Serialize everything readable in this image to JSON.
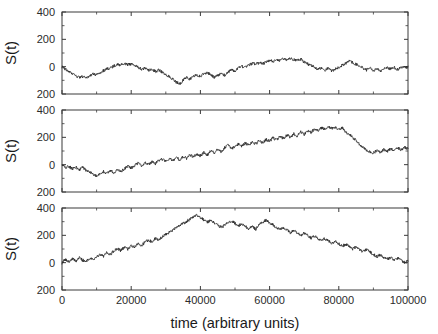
{
  "chart_data": {
    "type": "line",
    "title": "",
    "xlabel": "time (arbitrary units)",
    "ylabel": "S(t)",
    "xlim": [
      0,
      100000
    ],
    "ylim": [
      -200,
      400
    ],
    "xticks": [
      0,
      20000,
      40000,
      60000,
      80000,
      100000
    ],
    "xticklabels": [
      "0",
      "20000",
      "40000",
      "60000",
      "80000",
      "100000"
    ],
    "yticks": [
      -200,
      0,
      200,
      400
    ],
    "yticklabels": [
      "200",
      "0",
      "200",
      "400"
    ],
    "grid": false,
    "legend": null,
    "panels": [
      {
        "index": 0,
        "ylabel": "S(t)",
        "series_name": "S(t) realization 1",
        "x": [
          0,
          1000,
          2000,
          3000,
          4000,
          5000,
          6000,
          7000,
          8000,
          9000,
          10000,
          11000,
          12000,
          13000,
          14000,
          15000,
          16000,
          17000,
          18000,
          19000,
          20000,
          21000,
          22000,
          23000,
          24000,
          25000,
          26000,
          27000,
          28000,
          29000,
          30000,
          31000,
          32000,
          33000,
          34000,
          35000,
          36000,
          37000,
          38000,
          39000,
          40000,
          41000,
          42000,
          43000,
          44000,
          45000,
          46000,
          47000,
          48000,
          49000,
          50000,
          51000,
          52000,
          53000,
          54000,
          55000,
          56000,
          57000,
          58000,
          59000,
          60000,
          61000,
          62000,
          63000,
          64000,
          65000,
          66000,
          67000,
          68000,
          69000,
          70000,
          71000,
          72000,
          73000,
          74000,
          75000,
          76000,
          77000,
          78000,
          79000,
          80000,
          81000,
          82000,
          83000,
          84000,
          85000,
          86000,
          87000,
          88000,
          89000,
          90000,
          91000,
          92000,
          93000,
          94000,
          95000,
          96000,
          97000,
          98000,
          99000,
          100000
        ],
        "values": [
          0,
          -18,
          -38,
          -52,
          -68,
          -80,
          -72,
          -85,
          -66,
          -52,
          -60,
          -44,
          -30,
          -16,
          -8,
          5,
          18,
          12,
          24,
          14,
          20,
          8,
          -4,
          -18,
          -12,
          -28,
          -20,
          -34,
          -26,
          -40,
          -55,
          -72,
          -90,
          -112,
          -128,
          -100,
          -78,
          -92,
          -70,
          -60,
          -74,
          -52,
          -40,
          -60,
          -80,
          -66,
          -50,
          -62,
          -40,
          -22,
          -34,
          -12,
          2,
          -8,
          10,
          24,
          16,
          30,
          20,
          34,
          46,
          38,
          52,
          44,
          58,
          50,
          62,
          54,
          44,
          56,
          34,
          20,
          8,
          -6,
          -18,
          -8,
          -24,
          -12,
          -30,
          -18,
          -6,
          10,
          24,
          42,
          30,
          18,
          4,
          -10,
          -24,
          -12,
          -28,
          -14,
          -30,
          -16,
          -4,
          -18,
          -6,
          -20,
          -8,
          2,
          -10,
          4
        ],
        "ymin": -128,
        "ymax": 62
      },
      {
        "index": 1,
        "ylabel": "S(t)",
        "series_name": "S(t) realization 2",
        "x": [
          0,
          1000,
          2000,
          3000,
          4000,
          5000,
          6000,
          7000,
          8000,
          9000,
          10000,
          11000,
          12000,
          13000,
          14000,
          15000,
          16000,
          17000,
          18000,
          19000,
          20000,
          21000,
          22000,
          23000,
          24000,
          25000,
          26000,
          27000,
          28000,
          29000,
          30000,
          31000,
          32000,
          33000,
          34000,
          35000,
          36000,
          37000,
          38000,
          39000,
          40000,
          41000,
          42000,
          43000,
          44000,
          45000,
          46000,
          47000,
          48000,
          49000,
          50000,
          51000,
          52000,
          53000,
          54000,
          55000,
          56000,
          57000,
          58000,
          59000,
          60000,
          61000,
          62000,
          63000,
          64000,
          65000,
          66000,
          67000,
          68000,
          69000,
          70000,
          71000,
          72000,
          73000,
          74000,
          75000,
          76000,
          77000,
          78000,
          79000,
          80000,
          81000,
          82000,
          83000,
          84000,
          85000,
          86000,
          87000,
          88000,
          89000,
          90000,
          91000,
          92000,
          93000,
          94000,
          95000,
          96000,
          97000,
          98000,
          99000,
          100000
        ],
        "values": [
          0,
          -22,
          -12,
          -30,
          -18,
          -34,
          -22,
          -40,
          -52,
          -70,
          -86,
          -66,
          -50,
          -64,
          -44,
          -58,
          -38,
          -52,
          -30,
          -10,
          -24,
          -4,
          10,
          -6,
          14,
          2,
          22,
          8,
          28,
          40,
          26,
          44,
          30,
          52,
          38,
          60,
          46,
          70,
          56,
          78,
          64,
          88,
          72,
          100,
          86,
          112,
          96,
          124,
          140,
          118,
          132,
          150,
          136,
          158,
          144,
          168,
          152,
          176,
          160,
          184,
          172,
          196,
          180,
          206,
          192,
          218,
          200,
          226,
          210,
          238,
          222,
          250,
          236,
          262,
          248,
          272,
          258,
          280,
          264,
          270,
          254,
          268,
          240,
          222,
          200,
          176,
          150,
          128,
          108,
          96,
          86,
          104,
          92,
          110,
          98,
          116,
          104,
          122,
          110,
          126,
          118
        ],
        "ymin": -86,
        "ymax": 280
      },
      {
        "index": 2,
        "ylabel": "S(t)",
        "series_name": "S(t) realization 3",
        "x": [
          0,
          1000,
          2000,
          3000,
          4000,
          5000,
          6000,
          7000,
          8000,
          9000,
          10000,
          11000,
          12000,
          13000,
          14000,
          15000,
          16000,
          17000,
          18000,
          19000,
          20000,
          21000,
          22000,
          23000,
          24000,
          25000,
          26000,
          27000,
          28000,
          29000,
          30000,
          31000,
          32000,
          33000,
          34000,
          35000,
          36000,
          37000,
          38000,
          39000,
          40000,
          41000,
          42000,
          43000,
          44000,
          45000,
          46000,
          47000,
          48000,
          49000,
          50000,
          51000,
          52000,
          53000,
          54000,
          55000,
          56000,
          57000,
          58000,
          59000,
          60000,
          61000,
          62000,
          63000,
          64000,
          65000,
          66000,
          67000,
          68000,
          69000,
          70000,
          71000,
          72000,
          73000,
          74000,
          75000,
          76000,
          77000,
          78000,
          79000,
          80000,
          81000,
          82000,
          83000,
          84000,
          85000,
          86000,
          87000,
          88000,
          89000,
          90000,
          91000,
          92000,
          93000,
          94000,
          95000,
          96000,
          97000,
          98000,
          99000,
          100000
        ],
        "values": [
          0,
          24,
          6,
          30,
          12,
          36,
          18,
          10,
          34,
          20,
          46,
          62,
          48,
          74,
          60,
          86,
          102,
          88,
          114,
          100,
          126,
          112,
          138,
          124,
          150,
          166,
          152,
          178,
          164,
          190,
          206,
          222,
          238,
          256,
          270,
          286,
          302,
          318,
          334,
          350,
          330,
          312,
          296,
          310,
          292,
          276,
          258,
          272,
          290,
          306,
          288,
          270,
          284,
          266,
          248,
          262,
          244,
          280,
          296,
          312,
          294,
          276,
          258,
          240,
          256,
          238,
          220,
          236,
          218,
          200,
          216,
          198,
          180,
          196,
          178,
          160,
          176,
          158,
          140,
          156,
          138,
          120,
          136,
          118,
          100,
          116,
          98,
          80,
          96,
          78,
          60,
          44,
          58,
          40,
          24,
          38,
          20,
          34,
          16,
          2,
          10
        ],
        "ymin": 0,
        "ymax": 350
      }
    ]
  }
}
